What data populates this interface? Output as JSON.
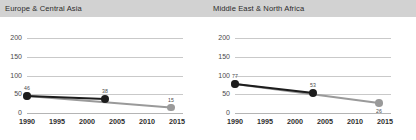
{
  "colors": {
    "header_band": "#d2d2d2",
    "background": "#ffffff",
    "grid": "#c9c9c9",
    "axis": "#b4b4b4",
    "series_dark": "#1c1c1c",
    "series_gray": "#9a9a9a",
    "tick_text": "#4a4a4a",
    "title_text": "#2b2b2b"
  },
  "panels": [
    {
      "key": "left",
      "title": "Europe & Central Asia"
    },
    {
      "key": "right",
      "title": "Middle East & North Africa"
    }
  ],
  "chart_data": [
    {
      "type": "line",
      "title": "Europe & Central Asia",
      "xlabel": "",
      "ylabel": "",
      "xlim": [
        1990,
        2016
      ],
      "ylim": [
        0,
        200
      ],
      "yticks": [
        0,
        50,
        100,
        150,
        200
      ],
      "xticks": [
        1990,
        1995,
        2000,
        2005,
        2010,
        2015
      ],
      "grid": true,
      "legend": "none",
      "series": [
        {
          "name": "dark",
          "color": "#1c1c1c",
          "x": [
            1990,
            2003
          ],
          "values": [
            46,
            38
          ],
          "point_labels": [
            "46",
            "38"
          ]
        },
        {
          "name": "gray",
          "color": "#9a9a9a",
          "x": [
            1990,
            2014
          ],
          "values": [
            46,
            15
          ],
          "point_labels": [
            "",
            "15"
          ]
        }
      ]
    },
    {
      "type": "line",
      "title": "Middle East & North Africa",
      "xlabel": "",
      "ylabel": "",
      "xlim": [
        1990,
        2016
      ],
      "ylim": [
        0,
        200
      ],
      "yticks": [
        0,
        50,
        100,
        150,
        200
      ],
      "xticks": [
        1990,
        1995,
        2000,
        2005,
        2010,
        2015
      ],
      "grid": true,
      "legend": "none",
      "series": [
        {
          "name": "dark",
          "color": "#1c1c1c",
          "x": [
            1990,
            2003
          ],
          "values": [
            77,
            53
          ],
          "point_labels": [
            "77",
            "53"
          ]
        },
        {
          "name": "gray",
          "color": "#9a9a9a",
          "x": [
            1990,
            2014
          ],
          "values": [
            77,
            26
          ],
          "point_labels": [
            "",
            "26"
          ]
        }
      ]
    }
  ]
}
